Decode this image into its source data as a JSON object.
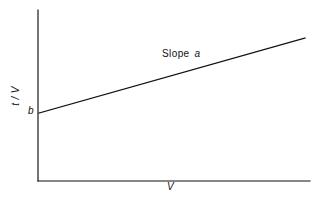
{
  "figure": {
    "background_color": "#ffffff",
    "ink_color": "#111111"
  },
  "labels": {
    "y_axis": "t / V",
    "x_axis": "V",
    "intercept": "b",
    "slope_word": "Slope",
    "slope_symbol": "a"
  },
  "chart_data": {
    "type": "line",
    "title": "",
    "subtitle": "",
    "xlabel": "V",
    "ylabel": "t / V",
    "grid": false,
    "legend": null,
    "xlim": [
      0,
      1
    ],
    "ylim": [
      0,
      1
    ],
    "axis_ticks": {
      "x": [],
      "y": []
    },
    "series": [
      {
        "name": "t/V vs V",
        "relationship": "t/V = a*V + b",
        "x": [
          0,
          1
        ],
        "y": [
          0.4,
          0.835
        ],
        "points_px": [
          [
            39,
            113
          ],
          [
            305,
            38
          ]
        ]
      }
    ],
    "annotations": [
      {
        "text": "Slope a",
        "kind": "slope-label",
        "position_px": [
          162,
          49
        ]
      },
      {
        "text": "b",
        "kind": "y-intercept-marker",
        "position_px": [
          28,
          106
        ]
      }
    ],
    "axes_px": {
      "y_axis": [
        [
          38,
          10
        ],
        [
          38,
          181
        ]
      ],
      "x_axis": [
        [
          38,
          181
        ],
        [
          310,
          181
        ]
      ]
    }
  }
}
